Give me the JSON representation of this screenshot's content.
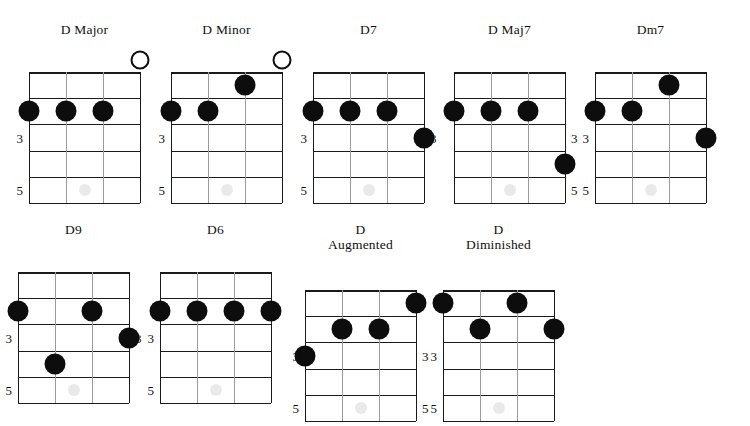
{
  "sheet": {
    "instrument": "ukulele",
    "string_count": 4,
    "fret_rows": 5,
    "fret_markers_shown": [
      "3",
      "5"
    ],
    "colors": {
      "dot_fill": "#0d0d0d",
      "open_ring": "#0d0d0d",
      "fret_line": "#1a1a1a",
      "string_line": "#9a9a9a",
      "inlay_marker": "#e9e9e9",
      "background": "#ffffff",
      "text": "#111111"
    },
    "rows": [
      {
        "row_index": 0,
        "chords": [
          {
            "name": "D Major",
            "title_lines": "D Major",
            "left_fret_labels": [
              "3",
              "5"
            ],
            "right_fret_labels": [],
            "open_strings": [
              4
            ],
            "muted_strings": [],
            "notes": [
              {
                "string": 1,
                "fret": 2
              },
              {
                "string": 2,
                "fret": 2
              },
              {
                "string": 3,
                "fret": 2
              }
            ]
          },
          {
            "name": "D Minor",
            "title_lines": "D Minor",
            "left_fret_labels": [
              "3",
              "5"
            ],
            "right_fret_labels": [],
            "open_strings": [
              4
            ],
            "muted_strings": [],
            "notes": [
              {
                "string": 1,
                "fret": 2
              },
              {
                "string": 2,
                "fret": 2
              },
              {
                "string": 3,
                "fret": 1
              }
            ]
          },
          {
            "name": "D7",
            "title_lines": "D7",
            "left_fret_labels": [
              "3",
              "5"
            ],
            "right_fret_labels": [
              "3"
            ],
            "open_strings": [],
            "muted_strings": [],
            "notes": [
              {
                "string": 1,
                "fret": 2
              },
              {
                "string": 2,
                "fret": 2
              },
              {
                "string": 3,
                "fret": 2
              },
              {
                "string": 4,
                "fret": 3
              }
            ]
          },
          {
            "name": "D Maj7",
            "title_lines": "D Maj7",
            "left_fret_labels": [],
            "right_fret_labels": [
              "3",
              "5"
            ],
            "open_strings": [],
            "muted_strings": [],
            "notes": [
              {
                "string": 1,
                "fret": 2
              },
              {
                "string": 2,
                "fret": 2
              },
              {
                "string": 3,
                "fret": 2
              },
              {
                "string": 4,
                "fret": 4
              }
            ]
          },
          {
            "name": "Dm7",
            "title_lines": "Dm7",
            "left_fret_labels": [
              "3",
              "5"
            ],
            "right_fret_labels": [],
            "open_strings": [],
            "muted_strings": [],
            "notes": [
              {
                "string": 1,
                "fret": 2
              },
              {
                "string": 2,
                "fret": 2
              },
              {
                "string": 3,
                "fret": 1
              },
              {
                "string": 4,
                "fret": 3
              }
            ]
          }
        ]
      },
      {
        "row_index": 1,
        "chords": [
          {
            "name": "D9",
            "title_lines": "D9",
            "left_fret_labels": [
              "3",
              "5"
            ],
            "right_fret_labels": [
              "3"
            ],
            "open_strings": [],
            "muted_strings": [],
            "notes": [
              {
                "string": 1,
                "fret": 2
              },
              {
                "string": 2,
                "fret": 4
              },
              {
                "string": 3,
                "fret": 2
              },
              {
                "string": 4,
                "fret": 3
              }
            ]
          },
          {
            "name": "D6",
            "title_lines": "D6",
            "left_fret_labels": [
              "3",
              "5"
            ],
            "right_fret_labels": [],
            "open_strings": [],
            "muted_strings": [],
            "notes": [
              {
                "string": 1,
                "fret": 2
              },
              {
                "string": 2,
                "fret": 2
              },
              {
                "string": 3,
                "fret": 2
              },
              {
                "string": 4,
                "fret": 2
              }
            ]
          },
          {
            "name": "D Augmented",
            "title_lines": "D\nAugmented",
            "left_fret_labels": [
              "3",
              "5"
            ],
            "right_fret_labels": [
              "3",
              "5"
            ],
            "open_strings": [],
            "muted_strings": [],
            "notes": [
              {
                "string": 1,
                "fret": 3
              },
              {
                "string": 2,
                "fret": 2
              },
              {
                "string": 3,
                "fret": 2
              },
              {
                "string": 4,
                "fret": 1
              }
            ]
          },
          {
            "name": "D Diminished",
            "title_lines": "D\nDiminished",
            "left_fret_labels": [
              "3",
              "5"
            ],
            "right_fret_labels": [],
            "open_strings": [],
            "muted_strings": [],
            "notes": [
              {
                "string": 1,
                "fret": 1
              },
              {
                "string": 2,
                "fret": 2
              },
              {
                "string": 3,
                "fret": 1
              },
              {
                "string": 4,
                "fret": 2
              }
            ]
          }
        ]
      }
    ]
  }
}
